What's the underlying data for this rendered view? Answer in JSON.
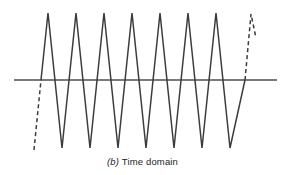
{
  "figure": {
    "caption_index": "(b)",
    "caption_text": "Time domain",
    "background_color": "#ffffff",
    "axis": {
      "label": "time-axis",
      "color": "#7a7a7a",
      "stroke_width": 2,
      "x_start": 14,
      "x_end": 277,
      "y": 80
    },
    "signal": {
      "color": "#3c3c3c",
      "stroke_width": 1.5,
      "waveform_type": "triangle",
      "cycles_solid": 8,
      "period_px": 28,
      "baseline_y": 80,
      "peak_y": 13,
      "trough_y": 148,
      "solid_start_x": 41,
      "solid_end_x": 245,
      "peaks_x": [
        48,
        76,
        104,
        132,
        160,
        188,
        216,
        244
      ],
      "troughs_x": [
        34,
        62,
        90,
        118,
        146,
        174,
        202,
        230
      ],
      "solid_path": "M 41,80 L 48,13 L 62,148 L 76,13 L 90,148 L 104,13 L 118,148 L 132,13 L 146,148 L 160,13 L 174,148 L 188,13 L 202,148 L 216,13 L 230,148 L 245,80",
      "dashed_lead_path": "M 34,150 L 41,80",
      "dashed_tail_path": "M 245,80 L 251,14 L 256,38",
      "dash_pattern": "4,3"
    }
  }
}
